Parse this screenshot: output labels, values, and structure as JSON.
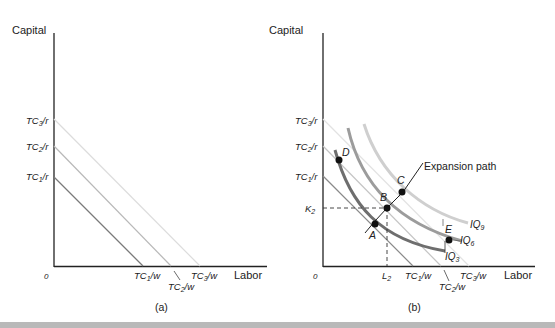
{
  "header": {
    "clipped_caption": ""
  },
  "panel_a": {
    "caption": "(a)",
    "y_axis_label": "Capital",
    "x_axis_label": "Labor",
    "origin_label": "0",
    "y_intercepts": [
      {
        "base": "TC",
        "sub": "1",
        "tail": "/r"
      },
      {
        "base": "TC",
        "sub": "2",
        "tail": "/r"
      },
      {
        "base": "TC",
        "sub": "3",
        "tail": "/r"
      }
    ],
    "x_intercepts": [
      {
        "base": "TC",
        "sub": "1",
        "tail": "/w"
      },
      {
        "base": "TC",
        "sub": "2",
        "tail": "/w"
      },
      {
        "base": "TC",
        "sub": "3",
        "tail": "/w"
      }
    ],
    "line_colors": [
      "#7a7a7a",
      "#b8b8b8",
      "#dcdcdc"
    ]
  },
  "panel_b": {
    "caption": "(b)",
    "y_axis_label": "Capital",
    "x_axis_label": "Labor",
    "origin_label": "0",
    "y_intercepts": [
      {
        "base": "TC",
        "sub": "1",
        "tail": "/r"
      },
      {
        "base": "TC",
        "sub": "2",
        "tail": "/r"
      },
      {
        "base": "TC",
        "sub": "3",
        "tail": "/r"
      }
    ],
    "x_intercepts": [
      {
        "base": "TC",
        "sub": "1",
        "tail": "/w"
      },
      {
        "base": "TC",
        "sub": "2",
        "tail": "/w"
      },
      {
        "base": "TC",
        "sub": "3",
        "tail": "/w"
      }
    ],
    "k_label": {
      "base": "K",
      "sub": "2"
    },
    "l_label": {
      "base": "L",
      "sub": "2"
    },
    "expansion_path_label": "Expansion path",
    "isoquants": [
      {
        "base": "IQ",
        "sub": "3",
        "color": "#6e6e6e"
      },
      {
        "base": "IQ",
        "sub": "6",
        "color": "#9c9c9c"
      },
      {
        "base": "IQ",
        "sub": "9",
        "color": "#cfcfcf"
      }
    ],
    "points": [
      "A",
      "B",
      "C",
      "D",
      "E"
    ]
  }
}
